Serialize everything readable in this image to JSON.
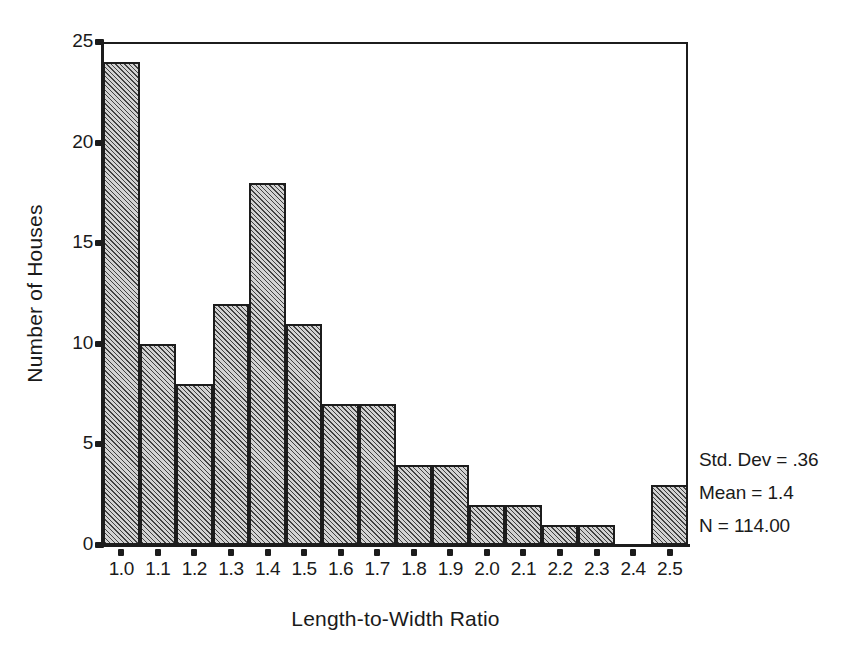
{
  "chart_data": {
    "type": "bar",
    "title": "",
    "subtitle": "",
    "xlabel": "Length-to-Width Ratio",
    "ylabel": "Number of Houses",
    "categories": [
      "1.0",
      "1.1",
      "1.2",
      "1.3",
      "1.4",
      "1.5",
      "1.6",
      "1.7",
      "1.8",
      "1.9",
      "2.0",
      "2.1",
      "2.2",
      "2.3",
      "2.4",
      "2.5"
    ],
    "values": [
      24,
      10,
      8,
      12,
      18,
      11,
      7,
      7,
      4,
      4,
      2,
      2,
      1,
      1,
      0,
      3
    ],
    "xlim": [
      0.95,
      2.55
    ],
    "ylim": [
      0,
      25
    ],
    "yticks": [
      0,
      5,
      10,
      15,
      20,
      25
    ],
    "ytick_labels": [
      "0",
      "5",
      "10",
      "15",
      "20",
      "25"
    ],
    "xticks": [
      "1.0",
      "1.1",
      "1.2",
      "1.3",
      "1.4",
      "1.5",
      "1.6",
      "1.7",
      "1.8",
      "1.9",
      "2.0",
      "2.1",
      "2.2",
      "2.3",
      "2.4",
      "2.5"
    ],
    "grid": false,
    "legend": null,
    "bar_fill": "#d2d2d2",
    "bar_edge": "#1c1c1c",
    "bar_hatch": "diagonal",
    "annotations": [
      "Std. Dev = .36",
      "Mean = 1.4",
      "N = 114.00"
    ]
  },
  "stats": {
    "std_dev_line": "Std. Dev = .36",
    "mean_line": "Mean = 1.4",
    "n_line": "N = 114.00"
  }
}
